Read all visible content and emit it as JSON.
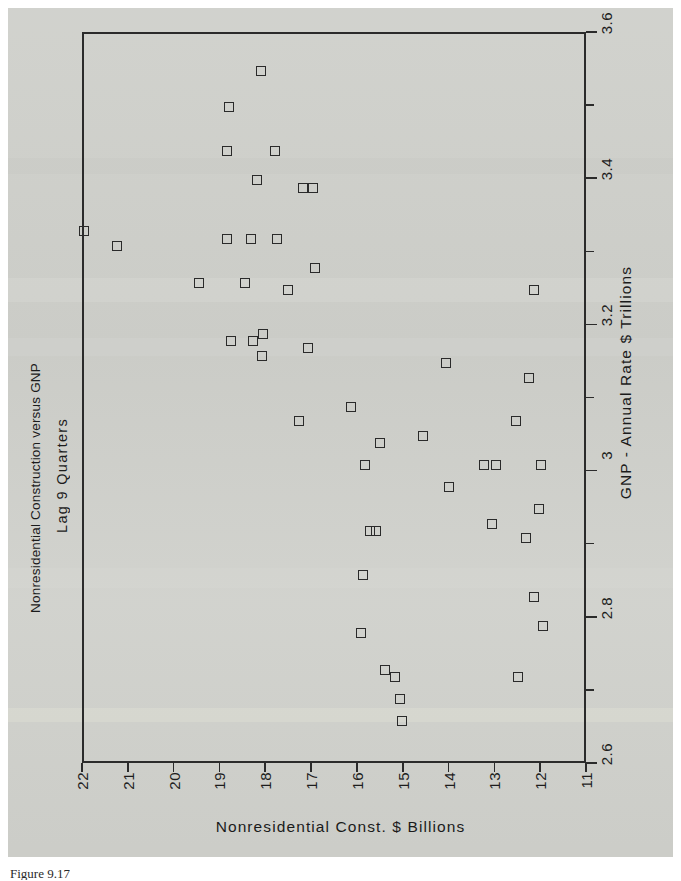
{
  "figure": {
    "caption": "Figure 9.17",
    "title": "Nonresidential Construction versus GNP",
    "subtitle": "Lag 9 Quarters"
  },
  "chart_data": {
    "type": "scatter",
    "title": "Nonresidential Construction versus GNP",
    "subtitle": "Lag 9 Quarters",
    "xlabel": "Nonresidential Const. $ Billions",
    "ylabel": "GNP - Annual Rate $ Trillions",
    "xlim": [
      22,
      11
    ],
    "ylim": [
      2.6,
      3.6
    ],
    "x_axis_position": "bottom",
    "y_axis_position": "right",
    "x_axis_reversed": true,
    "grid": false,
    "legend": null,
    "marker": "open-square",
    "marker_color": "#2a2a2a",
    "xticks": [
      "22",
      "21",
      "20",
      "19",
      "18",
      "17",
      "16",
      "15",
      "14",
      "13",
      "12",
      "11"
    ],
    "xtick_values": [
      22,
      21,
      20,
      19,
      18,
      17,
      16,
      15,
      14,
      13,
      12,
      11
    ],
    "yticks": [
      "2.6",
      "2.8",
      "3",
      "3.2",
      "3.4",
      "3.6"
    ],
    "ytick_values": [
      2.6,
      2.8,
      3.0,
      3.2,
      3.4,
      3.6
    ],
    "y_minor_ticks": [
      2.7,
      2.9,
      3.1,
      3.3,
      3.5
    ],
    "points": [
      {
        "x": 18.14,
        "y": 3.55
      },
      {
        "x": 18.84,
        "y": 3.5
      },
      {
        "x": 18.88,
        "y": 3.44
      },
      {
        "x": 17.83,
        "y": 3.44
      },
      {
        "x": 18.23,
        "y": 3.4
      },
      {
        "x": 17.22,
        "y": 3.39
      },
      {
        "x": 17.0,
        "y": 3.39
      },
      {
        "x": 22.0,
        "y": 3.33
      },
      {
        "x": 21.27,
        "y": 3.31
      },
      {
        "x": 18.88,
        "y": 3.32
      },
      {
        "x": 18.36,
        "y": 3.32
      },
      {
        "x": 17.79,
        "y": 3.32
      },
      {
        "x": 16.96,
        "y": 3.28
      },
      {
        "x": 19.5,
        "y": 3.26
      },
      {
        "x": 18.49,
        "y": 3.26
      },
      {
        "x": 17.55,
        "y": 3.25
      },
      {
        "x": 12.17,
        "y": 3.25
      },
      {
        "x": 18.8,
        "y": 3.18
      },
      {
        "x": 18.31,
        "y": 3.18
      },
      {
        "x": 18.1,
        "y": 3.19
      },
      {
        "x": 18.12,
        "y": 3.16
      },
      {
        "x": 17.11,
        "y": 3.17
      },
      {
        "x": 14.11,
        "y": 3.15
      },
      {
        "x": 12.28,
        "y": 3.13
      },
      {
        "x": 16.17,
        "y": 3.09
      },
      {
        "x": 17.3,
        "y": 3.07
      },
      {
        "x": 12.58,
        "y": 3.07
      },
      {
        "x": 14.6,
        "y": 3.05
      },
      {
        "x": 15.55,
        "y": 3.04
      },
      {
        "x": 13.0,
        "y": 3.01
      },
      {
        "x": 13.27,
        "y": 3.01
      },
      {
        "x": 12.02,
        "y": 3.01
      },
      {
        "x": 15.86,
        "y": 3.01
      },
      {
        "x": 14.04,
        "y": 2.98
      },
      {
        "x": 12.07,
        "y": 2.95
      },
      {
        "x": 13.09,
        "y": 2.93
      },
      {
        "x": 15.76,
        "y": 2.92
      },
      {
        "x": 15.63,
        "y": 2.92
      },
      {
        "x": 12.36,
        "y": 2.91
      },
      {
        "x": 15.92,
        "y": 2.86
      },
      {
        "x": 12.18,
        "y": 2.83
      },
      {
        "x": 11.98,
        "y": 2.79
      },
      {
        "x": 15.95,
        "y": 2.78
      },
      {
        "x": 15.42,
        "y": 2.73
      },
      {
        "x": 15.22,
        "y": 2.72
      },
      {
        "x": 12.52,
        "y": 2.72
      },
      {
        "x": 15.1,
        "y": 2.69
      },
      {
        "x": 15.07,
        "y": 2.66
      }
    ]
  }
}
